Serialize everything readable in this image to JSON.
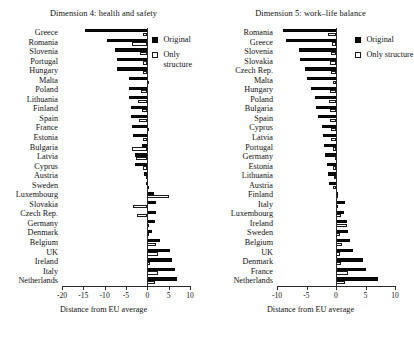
{
  "figure": {
    "axis_title": "Distance from EU average",
    "legend": {
      "original_label": "Original",
      "structure_label_wrapped": "Only\nstructure",
      "structure_label": "Only structure",
      "original_color": "#0a0a0a",
      "structure_color": "#ffffff"
    }
  },
  "chart_data": [
    {
      "type": "bar",
      "orientation": "horizontal",
      "title": "Dimension 4: health and safety",
      "xlabel": "Distance from EU average",
      "ylabel": "",
      "xlim": [
        -20,
        10
      ],
      "xticks": [
        -20,
        -15,
        -10,
        -5,
        0,
        5,
        10
      ],
      "xticklabels": [
        "-20",
        "-15",
        "-10",
        "-5",
        "0",
        "5",
        "10"
      ],
      "grid": false,
      "legend_position": "top-right",
      "categories": [
        "Greece",
        "Romania",
        "Slovenia",
        "Portugal",
        "Hungary",
        "Malta",
        "Poland",
        "Lithuania",
        "Finland",
        "Spain",
        "France",
        "Estonia",
        "Bulgaria",
        "Latvia",
        "Cyprus",
        "Austria",
        "Sweden",
        "Luxembourg",
        "Slovakia",
        "Czech Rep.",
        "Germany",
        "Denmark",
        "Belgium",
        "UK",
        "Ireland",
        "Italy",
        "Netherlands"
      ],
      "series": [
        {
          "name": "Original",
          "values": [
            -14.6,
            -9.4,
            -7.6,
            -7.2,
            -7.1,
            -4.2,
            -4.4,
            -4.3,
            -3.9,
            -3.8,
            -3.6,
            -3.4,
            -1.2,
            -2.8,
            -3.0,
            -0.8,
            -0.3,
            1.5,
            2.1,
            2.0,
            1.8,
            1.2,
            2.9,
            5.2,
            5.7,
            6.5,
            6.9
          ]
        },
        {
          "name": "Only structure",
          "values": [
            -1.1,
            -3.5,
            -1.8,
            -1.0,
            -1.1,
            0.4,
            -1.4,
            -2.1,
            -1.3,
            -2.0,
            0.1,
            -1.0,
            -3.7,
            -2.6,
            -1.1,
            -0.3,
            0.1,
            5.0,
            -3.4,
            -2.4,
            0.3,
            0.5,
            2.1,
            2.6,
            0.6,
            2.5,
            1.7
          ]
        }
      ]
    },
    {
      "type": "bar",
      "orientation": "horizontal",
      "title": "Dimension 5: work–life balance",
      "xlabel": "Distance from EU average",
      "ylabel": "",
      "xlim": [
        -10,
        10
      ],
      "xticks": [
        -10,
        -5,
        0,
        5,
        10
      ],
      "xticklabels": [
        "-10",
        "-5",
        "0",
        "5",
        "10"
      ],
      "grid": false,
      "legend_position": "top-right",
      "categories": [
        "Romania",
        "Greece",
        "Slovenia",
        "Slovakia",
        "Czech Rep.",
        "Malta",
        "Hungary",
        "Poland",
        "Bulgaria",
        "Spain",
        "Cyprus",
        "Latvia",
        "Portugal",
        "Germany",
        "Estonia",
        "Lithuania",
        "Austria",
        "Finland",
        "Italy",
        "Luxembourg",
        "Ireland",
        "Sweden",
        "Belgium",
        "UK",
        "Denmark",
        "France",
        "Netherlands"
      ],
      "series": [
        {
          "name": "Original",
          "values": [
            -8.9,
            -8.4,
            -6.3,
            -6.1,
            -5.2,
            -4.9,
            -4.3,
            -3.6,
            -3.4,
            -3.0,
            -2.4,
            -2.2,
            -2.0,
            -1.8,
            -1.5,
            -1.3,
            -1.2,
            0.3,
            1.5,
            1.4,
            1.8,
            2.0,
            2.4,
            2.8,
            4.5,
            5.0,
            7.1
          ]
        },
        {
          "name": "Only structure",
          "values": [
            -1.4,
            -0.7,
            -0.9,
            -1.1,
            -0.8,
            -0.5,
            -1.0,
            -1.2,
            -1.1,
            -1.1,
            -0.9,
            -0.8,
            -0.5,
            -0.1,
            -0.5,
            -0.3,
            -0.5,
            0.1,
            0.2,
            0.9,
            1.8,
            0.7,
            1.0,
            0.6,
            0.9,
            2.0,
            1.6
          ]
        }
      ]
    }
  ]
}
